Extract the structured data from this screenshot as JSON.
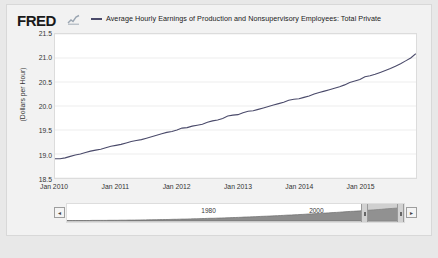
{
  "header": {
    "logo_text": "FRED",
    "logo_icon": "mini-line-chart-icon",
    "legend_label": "Average Hourly Earnings of Production and Nonsupervisory Employees: Total Private",
    "series_color": "#4a4a6a"
  },
  "navigator": {
    "year_labels": [
      "1980",
      "2000"
    ],
    "left_button_label": "◂",
    "right_button_label": "▸"
  },
  "chart_data": {
    "type": "line",
    "title": "",
    "xlabel": "",
    "ylabel": "(Dollars per Hour)",
    "ylim": [
      18.5,
      21.5
    ],
    "yticks": [
      "21.5",
      "21.0",
      "20.5",
      "20.0",
      "19.5",
      "19.0",
      "18.5"
    ],
    "ytick_values": [
      21.5,
      21.0,
      20.5,
      20.0,
      19.5,
      19.0,
      18.5
    ],
    "xticks": [
      "Jan 2010",
      "Jan 2011",
      "Jan 2012",
      "Jan 2013",
      "Jan 2014",
      "Jan 2015"
    ],
    "xtick_values": [
      2010.0,
      2011.0,
      2012.0,
      2013.0,
      2014.0,
      2015.0
    ],
    "xlim": [
      2010.0,
      2015.92
    ],
    "grid": true,
    "legend_position": "top",
    "series": [
      {
        "name": "Average Hourly Earnings of Production and Nonsupervisory Employees: Total Private",
        "color": "#4a4a6a",
        "x": [
          2010.0,
          2010.083,
          2010.167,
          2010.25,
          2010.333,
          2010.417,
          2010.5,
          2010.583,
          2010.667,
          2010.75,
          2010.833,
          2010.917,
          2011.0,
          2011.083,
          2011.167,
          2011.25,
          2011.333,
          2011.417,
          2011.5,
          2011.583,
          2011.667,
          2011.75,
          2011.833,
          2011.917,
          2012.0,
          2012.083,
          2012.167,
          2012.25,
          2012.333,
          2012.417,
          2012.5,
          2012.583,
          2012.667,
          2012.75,
          2012.833,
          2012.917,
          2013.0,
          2013.083,
          2013.167,
          2013.25,
          2013.333,
          2013.417,
          2013.5,
          2013.583,
          2013.667,
          2013.75,
          2013.833,
          2013.917,
          2014.0,
          2014.083,
          2014.167,
          2014.25,
          2014.333,
          2014.417,
          2014.5,
          2014.583,
          2014.667,
          2014.75,
          2014.833,
          2014.917,
          2015.0,
          2015.083,
          2015.167,
          2015.25,
          2015.333,
          2015.417,
          2015.5,
          2015.583,
          2015.667,
          2015.75,
          2015.833,
          2015.917
        ],
        "values": [
          18.9,
          18.9,
          18.92,
          18.95,
          18.98,
          19.0,
          19.03,
          19.06,
          19.08,
          19.1,
          19.13,
          19.16,
          19.18,
          19.2,
          19.23,
          19.26,
          19.28,
          19.3,
          19.33,
          19.36,
          19.39,
          19.42,
          19.45,
          19.47,
          19.5,
          19.54,
          19.55,
          19.58,
          19.6,
          19.62,
          19.66,
          19.69,
          19.71,
          19.74,
          19.79,
          19.81,
          19.82,
          19.86,
          19.89,
          19.9,
          19.93,
          19.96,
          19.99,
          20.02,
          20.05,
          20.08,
          20.12,
          20.14,
          20.15,
          20.18,
          20.21,
          20.25,
          20.28,
          20.31,
          20.34,
          20.37,
          20.4,
          20.44,
          20.49,
          20.52,
          20.55,
          20.61,
          20.63,
          20.66,
          20.7,
          20.74,
          20.78,
          20.83,
          20.88,
          20.94,
          21.0,
          21.09
        ]
      }
    ]
  }
}
